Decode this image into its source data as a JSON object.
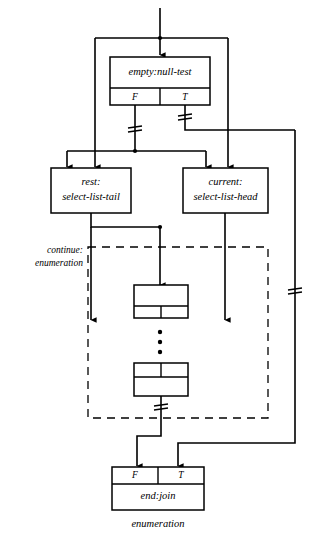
{
  "diagram": {
    "caption": "enumeration",
    "nodes": {
      "null_test": {
        "label": "empty:null-test",
        "port_false": "F",
        "port_true": "T"
      },
      "rest": {
        "label_line1": "rest:",
        "label_line2": "select-list-tail"
      },
      "current": {
        "label_line1": "current:",
        "label_line2": "select-list-head"
      },
      "inner_top": {
        "label": ""
      },
      "inner_bottom": {
        "label": ""
      },
      "end_join": {
        "label": "end:join",
        "port_false": "F",
        "port_true": "T"
      }
    },
    "region": {
      "label_line1": "continue:",
      "label_line2": "enumeration"
    },
    "ellipsis": "⋮",
    "colors": {
      "stroke": "#000000",
      "background": "#ffffff",
      "fill": "#ffffff"
    }
  }
}
